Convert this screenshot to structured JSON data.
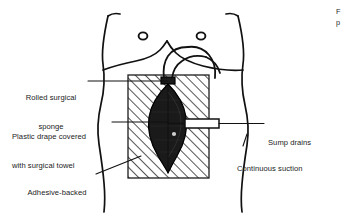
{
  "figure": {
    "type": "medical-illustration",
    "view": "anterior torso"
  },
  "labels": {
    "rolled_sponge": {
      "id": "rolled-surgical-sponge",
      "line1": "Rolled surgical",
      "line2": "sponge",
      "align": "center",
      "side": "left"
    },
    "plastic_drape": {
      "id": "plastic-drape-covered-with-surgical-towel",
      "line1": "Plastic drape covered",
      "line2": "with surgical towel",
      "align": "left",
      "side": "left"
    },
    "adhesive_plastic": {
      "id": "adhesive-backed-plastic",
      "line1": "Adhesive-backed",
      "line2": "plastic",
      "align": "center",
      "side": "left"
    },
    "sump_drains": {
      "id": "sump-drains",
      "line1": "Sump drains",
      "align": "left",
      "side": "right"
    },
    "continuous_suction": {
      "id": "continuous-suction",
      "line1": "Continuous suction",
      "align": "left",
      "side": "right"
    }
  },
  "edge_text": {
    "line1": "F",
    "line2": "p"
  },
  "anatomy": {
    "nipple_left": "left-nipple-marker",
    "nipple_right": "right-nipple-marker",
    "costal_margin": "costal-margin-outline",
    "torso": "torso-outline"
  },
  "colors": {
    "ink": "#111111",
    "text": "#1b1b1b",
    "paper": "#ffffff",
    "wound_fill": "#1a1a1a",
    "hatch": "#1d1d1d"
  }
}
